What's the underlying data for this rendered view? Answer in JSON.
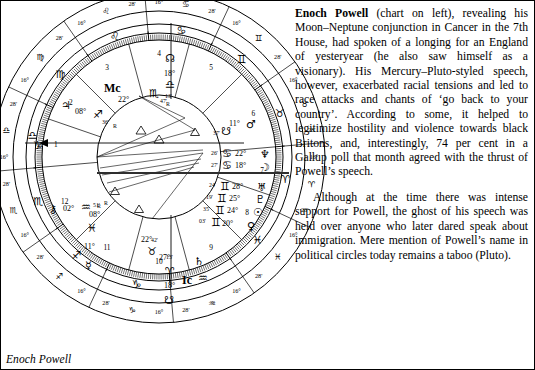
{
  "caption": "Enoch Powell",
  "article": {
    "subject": "Enoch Powell",
    "para1_rest": " (chart on left), revealing his Moon–Neptune conjunction in Cancer in the 7th House, had spoken of a longing for an England of yesteryear (he also saw himself as a visionary). His Mercury–Pluto-styled speech, however, exacerbated racial tensions and led to race attacks and chants of ‘go back to your country’. According to some, it helped to legitimize hostility and violence towards black Britons, and, interestingly, 74 per cent in a Gallup poll that month agreed with the thrust of Powell’s speech.",
    "para2": "Although at the time there was intense support for Powell, the ghost of his speech was held over anyone who later dared speak about immigration. Mere mention of Powell’s name in political circles today remains a taboo (Pluto)."
  },
  "chart_data": {
    "type": "astrological-natal-wheel",
    "title": "Enoch Powell",
    "outer_ring_signs": [
      {
        "glyph": "♎",
        "name": "Libra",
        "left_deg": "16°",
        "right_deg": "28'"
      },
      {
        "glyph": "♍",
        "name": "Virgo",
        "left_deg": "16°",
        "right_deg": "28'"
      },
      {
        "glyph": "♌",
        "name": "Leo",
        "left_deg": "16°",
        "right_deg": "28'"
      },
      {
        "glyph": "♋",
        "name": "Cancer",
        "left_deg": "16°",
        "right_deg": "28'"
      },
      {
        "glyph": "♊",
        "name": "Gemini",
        "left_deg": "16°",
        "right_deg": "28'"
      },
      {
        "glyph": "♉",
        "name": "Taurus",
        "left_deg": "16°",
        "right_deg": "28'"
      },
      {
        "glyph": "♈",
        "name": "Aries",
        "left_deg": "16°",
        "right_deg": "28'"
      },
      {
        "glyph": "♓",
        "name": "Pisces",
        "left_deg": "16°",
        "right_deg": "28'"
      },
      {
        "glyph": "♒",
        "name": "Aquarius",
        "left_deg": "16°",
        "right_deg": "28'"
      },
      {
        "glyph": "♑",
        "name": "Capricorn",
        "left_deg": "16°",
        "right_deg": "28'"
      },
      {
        "glyph": "♐",
        "name": "Sagittarius",
        "left_deg": "16°",
        "right_deg": "28'"
      },
      {
        "glyph": "♏",
        "name": "Scorpio",
        "left_deg": "16°",
        "right_deg": "28'"
      }
    ],
    "house_numbers": [
      "1",
      "2",
      "3",
      "4",
      "5",
      "6",
      "7",
      "8",
      "9",
      "10",
      "11",
      "12"
    ],
    "angles": [
      {
        "name": "MC",
        "label": "Mc",
        "deg": "22°",
        "sign": "♏",
        "min": "47'"
      },
      {
        "name": "IC",
        "label": "Ic",
        "deg": "22°",
        "sign": "♉",
        "min": "47'"
      }
    ],
    "planets": [
      {
        "name": "Neptune",
        "glyph": "♆",
        "deg": "22°",
        "sign": "♋",
        "min": "26'",
        "retro": ""
      },
      {
        "name": "Moon",
        "glyph": "☽",
        "deg": "18°",
        "sign": "♋",
        "min": "27'",
        "retro": ""
      },
      {
        "name": "Uranus",
        "glyph": "♅",
        "deg": "28°",
        "sign": "♊",
        "min": "24'",
        "retro": ""
      },
      {
        "name": "Pluto",
        "glyph": "♇",
        "deg": "25°",
        "sign": "♊",
        "min": "19'",
        "retro": ""
      },
      {
        "name": "Sun",
        "glyph": "☉",
        "deg": "24°",
        "sign": "♊",
        "min": "35'",
        "retro": ""
      },
      {
        "name": "Venus",
        "glyph": "♀",
        "deg": "20°",
        "sign": "♊",
        "min": "03'",
        "retro": ""
      },
      {
        "name": "Mars",
        "glyph": "♂",
        "deg": "11°",
        "sign": "♌",
        "min": "37'",
        "retro": ""
      },
      {
        "name": "Saturn",
        "glyph": "♄",
        "deg": "27°",
        "sign": "♉",
        "min": "42'",
        "retro": ""
      },
      {
        "name": "Jupiter",
        "glyph": "♃",
        "deg": "08°",
        "sign": "♐",
        "min": "36'",
        "retro": "R"
      },
      {
        "name": "Mercury",
        "glyph": "☿",
        "deg": "08°",
        "sign": "♓",
        "min": "",
        "retro": "R"
      },
      {
        "name": "Chiron",
        "glyph": "⚷",
        "deg": "02°",
        "sign": "♒",
        "min": "51'",
        "retro": "R"
      },
      {
        "name": "North Node",
        "glyph": "☊",
        "deg": "18°",
        "sign": "♎",
        "min": "13'",
        "retro": "R"
      },
      {
        "name": "South Node",
        "glyph": "☋",
        "deg": "18°",
        "sign": "♈",
        "min": "13'",
        "retro": ""
      }
    ],
    "node_marks": [
      {
        "name": "node-leo",
        "glyph": "☋",
        "deg": "11°",
        "min": "37'",
        "sign": "♌"
      },
      {
        "name": "node-pisces",
        "glyph": "☋",
        "deg": "11°",
        "min": "",
        "sign": "♓"
      }
    ],
    "ring_tick_labels_left": [
      "16°",
      "28'"
    ],
    "ring_tick_labels_right": [
      "16°",
      "28'"
    ]
  }
}
